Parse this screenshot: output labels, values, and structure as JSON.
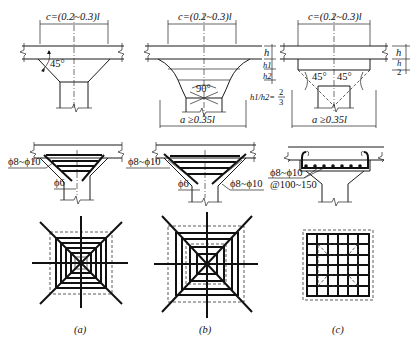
{
  "figure": {
    "panels": [
      {
        "id": "a",
        "caption": "(a)",
        "section_labels": {
          "capital_width": "c=(0.2~0.3)l",
          "slope_angle": "45°"
        },
        "rebar_labels": {
          "main": "ϕ8~ϕ10",
          "tie": "ϕ6"
        }
      },
      {
        "id": "b",
        "caption": "(b)",
        "section_labels": {
          "capital_width": "c=(0.2~0.3)l",
          "apex_angle": "90°",
          "h": "h",
          "h1": "h1",
          "h2": "h2",
          "ratio": "h1/h2 = 2/3",
          "drop_width": "a ≥0.35l"
        },
        "rebar_labels": {
          "main": "ϕ8~ϕ10",
          "tie": "ϕ6",
          "side": "ϕ8~ϕ10"
        }
      },
      {
        "id": "c",
        "caption": "(c)",
        "section_labels": {
          "capital_width": "c=(0.2~0.3)l",
          "angle_left": "45°",
          "angle_right": "45°",
          "h": "h",
          "half_h": "h/2",
          "drop_width": "a ≥0.35l"
        },
        "rebar_labels": {
          "main": "ϕ8~ϕ10",
          "spacing": "@100~150"
        }
      }
    ]
  },
  "text": {
    "a_c": "c=(0.2~0.3)l",
    "a_angle": "45°",
    "a_rebar": "ϕ8~ϕ10",
    "a_tie": "ϕ6",
    "a_cap": "(a)",
    "b_c": "c=(0.2~0.3)l",
    "b_angle": "90°",
    "b_h": "h",
    "b_h1": "h1",
    "b_h2": "h2",
    "b_ratio_l": "h1/h2=",
    "b_ratio_n": "2",
    "b_ratio_d": "3",
    "b_a": "a ≥0.35l",
    "b_rebar": "ϕ8~ϕ10",
    "b_tie": "ϕ6",
    "b_side": "ϕ8~ϕ10",
    "b_cap": "(b)",
    "c_c": "c=(0.2~0.3)l",
    "c_angle_l": "45°",
    "c_angle_r": "45°",
    "c_h": "h",
    "c_hn": "h",
    "c_hd": "2",
    "c_a": "a ≥0.35l",
    "c_rebar": "ϕ8~ϕ10",
    "c_spacing": "@100~150",
    "c_cap": "(c)"
  }
}
